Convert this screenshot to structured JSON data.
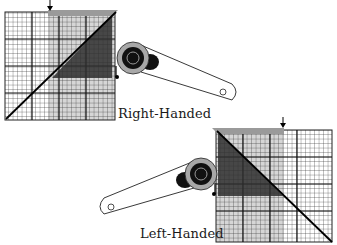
{
  "figure": {
    "labels": {
      "right_handed": "Right-Handed",
      "left_handed": "Left-Handed"
    },
    "colors": {
      "grid_line": "#222222",
      "light_strip": "#b8b8b8",
      "dark_triangle": "#3a3a3a",
      "cutter_ring": "#a8a8a8",
      "cutter_body": "#111111",
      "background": "#ffffff"
    },
    "panels": [
      {
        "id": "right-handed",
        "grid": {
          "x": 5,
          "y": 12,
          "w": 110,
          "h": 108,
          "fine_step": 4.5,
          "bold_every": 6
        },
        "arrow_x": 50,
        "cutter": {
          "cx": 135,
          "cy": 58,
          "arm_end_x": 233,
          "arm_end_y": 92
        }
      },
      {
        "id": "left-handed",
        "grid": {
          "x": 216,
          "y": 130,
          "w": 116,
          "h": 112,
          "fine_step": 4.5,
          "bold_every": 6
        },
        "arrow_x": 283,
        "cutter": {
          "cx": 200,
          "cy": 174,
          "arm_end_x": 106,
          "arm_end_y": 208
        }
      }
    ]
  }
}
